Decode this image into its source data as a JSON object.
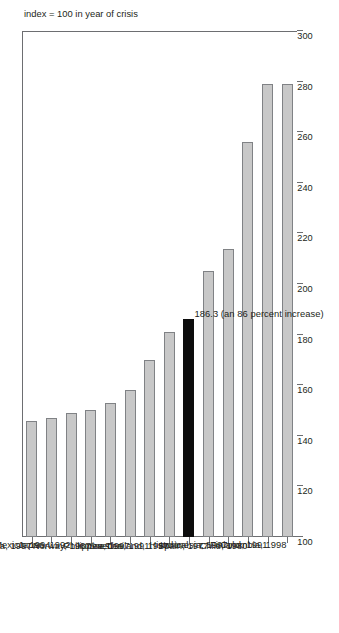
{
  "chart_data": {
    "type": "bar",
    "orientation": "horizontal",
    "title": "",
    "subtitle": "",
    "xlabel": "index = 100 in year of crisis",
    "ylabel": "",
    "xlim": [
      100,
      300
    ],
    "xticks": [
      100,
      120,
      140,
      160,
      180,
      200,
      220,
      240,
      260,
      280,
      300
    ],
    "grid": false,
    "legend": null,
    "categories": [
      "Malaysia, 1997",
      "Mexico, 1994",
      "Japan, 1992",
      "Norway, 1987",
      "Philippines",
      "Korea, 1997",
      "Sweden, 1991",
      "Thailand, 1997",
      "Historical",
      "Spain, 1977",
      "Indonesia, 1997",
      "Chile, 1980",
      "Finland, 1991",
      "Colombia, 1998"
    ],
    "values": [
      146,
      147,
      149,
      150,
      153,
      158,
      170,
      181,
      186.3,
      205,
      214,
      256,
      279,
      279
    ],
    "highlight_category": "Historical",
    "annotations": [
      {
        "category": "Historical",
        "text": "186.3 (an 86 percent increase)"
      }
    ],
    "colors": {
      "bar_fill": "#c8c8c8",
      "bar_stroke": "#808285",
      "highlight_fill": "#0d0d0d",
      "axis": "#6d6e71",
      "text": "#231f20"
    }
  },
  "axis": {
    "value_axis_title": "index = 100 in year of crisis",
    "tick_labels": [
      "100",
      "120",
      "140",
      "160",
      "180",
      "200",
      "220",
      "240",
      "260",
      "280",
      "300"
    ]
  },
  "annotation": {
    "historical_value_label": "186.3 (an 86 percent increase)"
  }
}
